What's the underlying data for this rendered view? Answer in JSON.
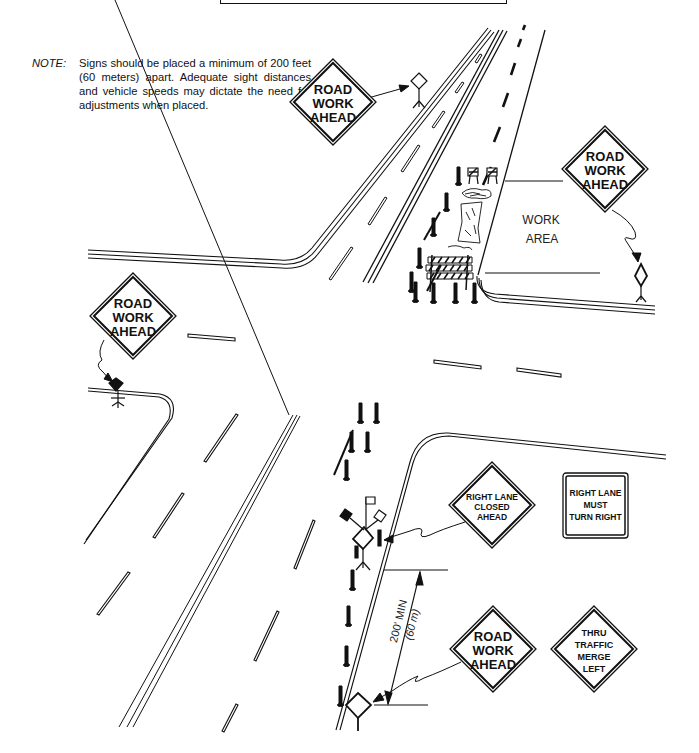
{
  "figure": {
    "title_box": "",
    "note": {
      "label": "NOTE:",
      "text": "Signs should be placed a minimum of 200 feet (60 meters) apart. Adequate sight distances and vehicle speeds may dictate the need for adjustments when placed."
    },
    "work_area_label": [
      "WORK",
      "AREA"
    ],
    "dimension": {
      "line1": "200' MIN",
      "line2": "(60 m)"
    },
    "signs": [
      {
        "id": "road-work-ahead-top",
        "shape": "diamond",
        "lines": [
          "ROAD",
          "WORK",
          "AHEAD"
        ]
      },
      {
        "id": "road-work-ahead-right",
        "shape": "diamond",
        "lines": [
          "ROAD",
          "WORK",
          "AHEAD"
        ]
      },
      {
        "id": "road-work-ahead-left",
        "shape": "diamond",
        "lines": [
          "ROAD",
          "WORK",
          "AHEAD"
        ]
      },
      {
        "id": "right-lane-closed-ahead",
        "shape": "diamond",
        "lines": [
          "RIGHT LANE",
          "CLOSED",
          "AHEAD"
        ]
      },
      {
        "id": "right-lane-must-turn-right",
        "shape": "rectangle",
        "lines": [
          "RIGHT LANE",
          "MUST",
          "TURN RIGHT"
        ]
      },
      {
        "id": "road-work-ahead-bottom",
        "shape": "diamond",
        "lines": [
          "ROAD",
          "WORK",
          "AHEAD"
        ]
      },
      {
        "id": "thru-traffic-merge-left",
        "shape": "diamond",
        "lines": [
          "THRU",
          "TRAFFIC",
          "MERGE",
          "LEFT"
        ]
      }
    ],
    "colors": {
      "ink": "#111111",
      "background": "#ffffff"
    }
  }
}
